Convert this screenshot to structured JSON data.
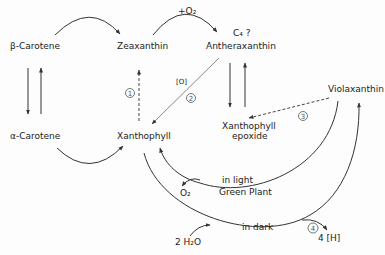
{
  "nodes": {
    "beta_carotene": "β-Carotene",
    "alpha_carotene": "α-Carotene",
    "zeaxanthin": "Zeaxanthin",
    "xanthophyll": "Xanthophyll",
    "c4": "C₄ ?",
    "antheraxanthin": "Antheraxanthin",
    "violaxanthin": "Violaxanthin",
    "xanthophyll_epoxide_1": "Xanthophyll",
    "xanthophyll_epoxide_2": "epoxide"
  },
  "labels": {
    "plus_o2": "+O₂",
    "oxidant": "[O]",
    "in_light": "in light",
    "green_plant": "Green Plant",
    "o2": "O₂",
    "in_dark": "in dark",
    "h2o": "2 H₂O",
    "h": "4 [H]"
  },
  "step_numbers": [
    "1",
    "2",
    "3",
    "4"
  ]
}
